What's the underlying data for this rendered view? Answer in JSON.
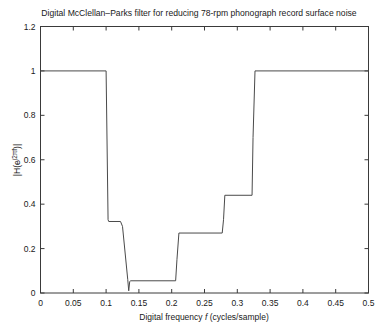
{
  "chart_data": {
    "type": "line",
    "title": "Digital McClellan–Parks filter for reducing 78-rpm phonograph record surface noise",
    "xlabel": "Digital frequency f (cycles/sample)",
    "ylabel": "|H(e^{j2πf})|",
    "ylabel_parts": {
      "pre": "|H(e",
      "sup_j": "j",
      "sup_rest": "2πf",
      "post": ")|"
    },
    "xlabel_parts": {
      "pre": "Digital frequency ",
      "italic": "f",
      "post": " (cycles/sample)"
    },
    "xlim": [
      0,
      0.5
    ],
    "ylim": [
      0,
      1.2
    ],
    "xticks": [
      0,
      0.05,
      0.1,
      0.15,
      0.2,
      0.25,
      0.3,
      0.35,
      0.4,
      0.45,
      0.5
    ],
    "xticklabels": [
      "0",
      "0.05",
      "0.1",
      "0.15",
      "0.2",
      "0.25",
      "0.3",
      "0.35",
      "0.4",
      "0.45",
      "0.5"
    ],
    "yticks": [
      0,
      0.2,
      0.4,
      0.6,
      0.8,
      1,
      1.2
    ],
    "yticklabels": [
      "0",
      "0.2",
      "0.4",
      "0.6",
      "0.8",
      "1",
      "1.2"
    ],
    "grid": false,
    "legend": null,
    "line_color": "#4a4a4a",
    "axis_color": "#3a3a3a",
    "background": "#ffffff",
    "series": [
      {
        "name": "|H(e^{j2πf})| magnitude response",
        "x": [
          0.0,
          0.1,
          0.103,
          0.104,
          0.122,
          0.125,
          0.133,
          0.1345,
          0.136,
          0.1375,
          0.206,
          0.208,
          0.211,
          0.277,
          0.279,
          0.281,
          0.3225,
          0.324,
          0.327,
          0.5
        ],
        "y": [
          1.0,
          1.0,
          0.33,
          0.322,
          0.322,
          0.3,
          0.06,
          0.01,
          0.052,
          0.055,
          0.055,
          0.15,
          0.27,
          0.27,
          0.33,
          0.44,
          0.44,
          0.7,
          1.0,
          1.0
        ]
      }
    ],
    "description_points": {
      "passband_low_end": 0.1,
      "passband_low_level": 1.0,
      "shelf1_level": 0.32,
      "shelf1_range": [
        0.104,
        0.125
      ],
      "notch_frequency": 0.1345,
      "notch_level": 0.01,
      "stopband_level": 0.055,
      "stopband_range": [
        0.136,
        0.206
      ],
      "shelf2_level": 0.27,
      "shelf2_range": [
        0.211,
        0.277
      ],
      "shelf3_level": 0.44,
      "shelf3_range": [
        0.281,
        0.3225
      ],
      "passband_high_start": 0.327,
      "passband_high_level": 1.0
    }
  }
}
